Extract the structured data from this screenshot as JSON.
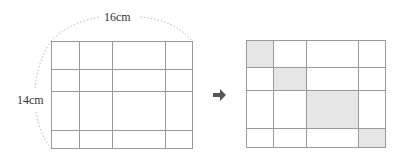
{
  "labels": {
    "width": "16cm",
    "height": "14cm"
  },
  "arrow_icon": "right-arrow",
  "colors": {
    "grid_line": "#9a9a9a",
    "shade": "#e6e6e6",
    "dotted": "#b5b5b5",
    "arrow": "#555555"
  },
  "left_grid": {
    "columns": 4,
    "rows": 4,
    "shaded_cells": []
  },
  "right_grid": {
    "columns": 4,
    "rows": 4,
    "shaded_cells": [
      [
        0,
        0
      ],
      [
        1,
        1
      ],
      [
        2,
        2
      ],
      [
        3,
        3
      ]
    ]
  }
}
